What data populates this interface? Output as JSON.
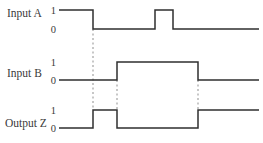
{
  "colors": {
    "background": "#ffffff",
    "wave_line": "#2f2f2f",
    "dashed_line": "#8f8f8f",
    "text": "#3a3a3a"
  },
  "diagram": {
    "width": 263,
    "height": 143,
    "x_start": 59,
    "x_end": 259,
    "level_label_x": 56,
    "signals": [
      {
        "id": "input-a",
        "label": "Input A",
        "high_label": "1",
        "low_label": "0",
        "label_x": 7,
        "label_y": 17,
        "y_high": 10,
        "y_low": 29,
        "initial_level": 1,
        "transition_xs": [
          93,
          155,
          173
        ]
      },
      {
        "id": "input-b",
        "label": "Input B",
        "high_label": "1",
        "low_label": "0",
        "label_x": 7,
        "label_y": 77,
        "y_high": 62,
        "y_low": 80,
        "initial_level": 0,
        "transition_xs": [
          117,
          198
        ]
      },
      {
        "id": "output-z",
        "label": "Output Z",
        "high_label": "1",
        "low_label": "0",
        "label_x": 5,
        "label_y": 127,
        "y_high": 110,
        "y_low": 128,
        "initial_level": 0,
        "transition_xs": [
          93,
          117,
          198
        ]
      }
    ],
    "dashed_lines": [
      {
        "x": 93,
        "y1": 29,
        "y2": 110
      },
      {
        "x": 117,
        "y1": 80,
        "y2": 110
      },
      {
        "x": 198,
        "y1": 80,
        "y2": 110
      }
    ]
  }
}
